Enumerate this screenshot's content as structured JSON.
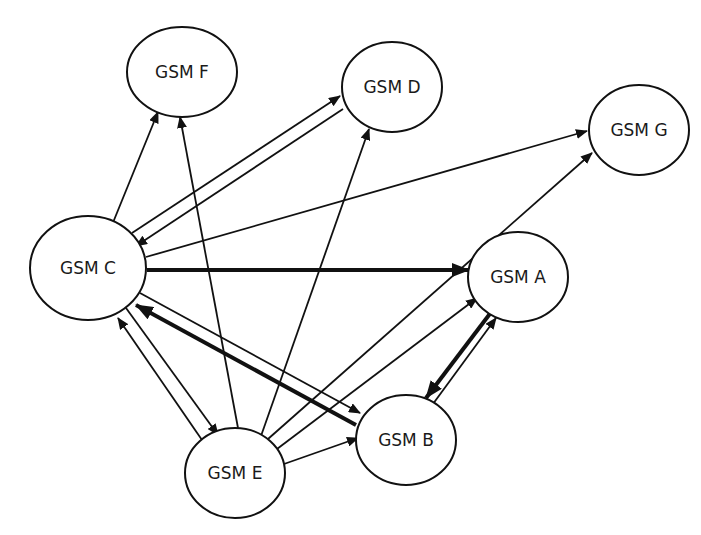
{
  "diagram": {
    "type": "directed-graph",
    "nodes": [
      {
        "id": "F",
        "label": "GSM F",
        "cx": 182,
        "cy": 72,
        "rx": 55,
        "ry": 45
      },
      {
        "id": "D",
        "label": "GSM D",
        "cx": 392,
        "cy": 87,
        "rx": 50,
        "ry": 45
      },
      {
        "id": "G",
        "label": "GSM G",
        "cx": 639,
        "cy": 130,
        "rx": 50,
        "ry": 45
      },
      {
        "id": "C",
        "label": "GSM C",
        "cx": 88,
        "cy": 268,
        "rx": 58,
        "ry": 52
      },
      {
        "id": "A",
        "label": "GSM A",
        "cx": 518,
        "cy": 277,
        "rx": 50,
        "ry": 45
      },
      {
        "id": "B",
        "label": "GSM B",
        "cx": 406,
        "cy": 440,
        "rx": 50,
        "ry": 45
      },
      {
        "id": "E",
        "label": "GSM E",
        "cx": 235,
        "cy": 473,
        "rx": 50,
        "ry": 45
      }
    ],
    "edges": [
      {
        "from": "C",
        "to": "F",
        "weight": "thin",
        "x1": 112,
        "y1": 225,
        "x2": 158,
        "y2": 112
      },
      {
        "from": "C",
        "to": "D",
        "weight": "thin",
        "x1": 132,
        "y1": 233,
        "x2": 340,
        "y2": 96
      },
      {
        "from": "D",
        "to": "C",
        "weight": "thin",
        "x1": 343,
        "y1": 109,
        "x2": 136,
        "y2": 246
      },
      {
        "from": "C",
        "to": "G",
        "weight": "thin",
        "x1": 146,
        "y1": 257,
        "x2": 587,
        "y2": 131
      },
      {
        "from": "C",
        "to": "A",
        "weight": "thick",
        "x1": 147,
        "y1": 270,
        "x2": 469,
        "y2": 270
      },
      {
        "from": "C",
        "to": "B",
        "weight": "thin",
        "x1": 140,
        "y1": 293,
        "x2": 360,
        "y2": 413
      },
      {
        "from": "B",
        "to": "C",
        "weight": "thick",
        "x1": 356,
        "y1": 425,
        "x2": 136,
        "y2": 305
      },
      {
        "from": "C",
        "to": "E",
        "weight": "thin",
        "x1": 126,
        "y1": 308,
        "x2": 218,
        "y2": 435
      },
      {
        "from": "E",
        "to": "C",
        "weight": "thin",
        "x1": 202,
        "y1": 440,
        "x2": 118,
        "y2": 318
      },
      {
        "from": "E",
        "to": "F",
        "weight": "thin",
        "x1": 238,
        "y1": 428,
        "x2": 180,
        "y2": 117
      },
      {
        "from": "E",
        "to": "D",
        "weight": "thin",
        "x1": 261,
        "y1": 436,
        "x2": 369,
        "y2": 129
      },
      {
        "from": "E",
        "to": "G",
        "weight": "thin",
        "x1": 268,
        "y1": 439,
        "x2": 592,
        "y2": 153
      },
      {
        "from": "E",
        "to": "A",
        "weight": "thin",
        "x1": 277,
        "y1": 449,
        "x2": 477,
        "y2": 298
      },
      {
        "from": "E",
        "to": "B",
        "weight": "thin",
        "x1": 284,
        "y1": 464,
        "x2": 358,
        "y2": 438
      },
      {
        "from": "A",
        "to": "B",
        "weight": "thick",
        "x1": 492,
        "y1": 311,
        "x2": 426,
        "y2": 398
      },
      {
        "from": "B",
        "to": "A",
        "weight": "thin",
        "x1": 430,
        "y1": 408,
        "x2": 496,
        "y2": 318
      }
    ]
  }
}
